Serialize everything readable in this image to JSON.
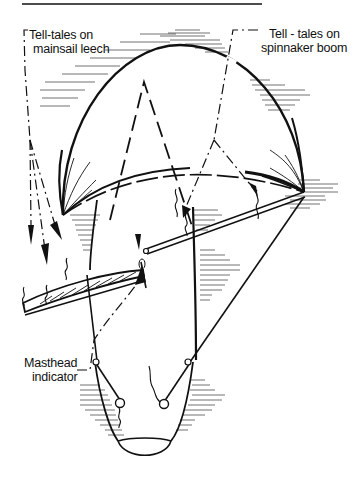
{
  "figure": {
    "type": "line-art diagram",
    "colors": {
      "ink": "#111111",
      "background": "#ffffff"
    }
  },
  "labels": {
    "mainsail_leech": {
      "line1": "Tell-tales on",
      "line2": "mainsail leech"
    },
    "spinnaker_boom": {
      "line1": "Tell - tales on",
      "line2": "spinnaker boom"
    },
    "masthead": {
      "line1": "Masthead",
      "line2": "indicator"
    }
  },
  "components": [
    "spinnaker",
    "mainsail-leech",
    "spinnaker-boom",
    "masthead-indicator",
    "tell-tales",
    "arrows",
    "boat-hull"
  ]
}
